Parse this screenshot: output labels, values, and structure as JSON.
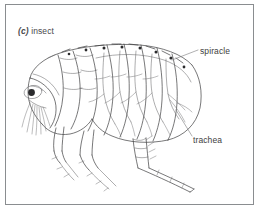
{
  "figure": {
    "caption_letter": "(c)",
    "caption_text": "insect",
    "border_color": "#8a8d90",
    "ink_color": "#3d3d3f",
    "background_color": "#ffffff"
  },
  "labels": {
    "spiracle": "spiracle",
    "trachea": "trachea"
  },
  "diagram_parts": [
    "head",
    "compound-eye",
    "antenna-bristles",
    "thorax-segments",
    "abdomen-segments",
    "dorsal-bristles",
    "spiracle-openings",
    "tracheal-tubes",
    "foreleg",
    "midleg",
    "hindleg"
  ]
}
